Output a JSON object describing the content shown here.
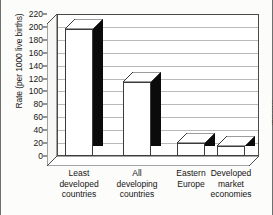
{
  "chart_data": {
    "type": "bar",
    "title": "",
    "subtitle": "",
    "xlabel": "",
    "ylabel": "Rate (per 1000 live births)",
    "ylim": [
      0,
      220
    ],
    "ytick_step": 20,
    "yticks": [
      0,
      20,
      40,
      60,
      80,
      100,
      120,
      140,
      160,
      180,
      200,
      220
    ],
    "grid": true,
    "legend": "none",
    "style": "3d-bars",
    "categories": [
      "Least\ndeveloped\ncountries",
      "All\ndeveloping\ncountries",
      "Eastern\nEurope",
      "Developed\nmarket\neconomies"
    ],
    "categories_flat": [
      "Least developed countries",
      "All developing countries",
      "Eastern Europe",
      "Developed market economies"
    ],
    "values": [
      197,
      115,
      20,
      15
    ],
    "annotations": [
      "WHO 93142"
    ]
  },
  "axis": {
    "y_title": "Rate (per 1000 live births)",
    "tick_0": "0",
    "tick_20": "20",
    "tick_40": "40",
    "tick_60": "60",
    "tick_80": "80",
    "tick_100": "100",
    "tick_120": "120",
    "tick_140": "140",
    "tick_160": "160",
    "tick_180": "180",
    "tick_200": "200",
    "tick_220": "220"
  },
  "labels": {
    "cat_0": "Least\ndeveloped\ncountries",
    "cat_1": "All\ndeveloping\ncountries",
    "cat_2": "Eastern\nEurope",
    "cat_3": "Developed\nmarket\neconomies"
  },
  "credit": {
    "text": "WHO 93142"
  },
  "colors": {
    "bar_front": "#ffffff",
    "bar_side": "#0b0b0b",
    "bar_outline": "#3b3b3b",
    "background": "#fcfcfa",
    "grid": "#b9b9b9",
    "axis": "#2a2a2a",
    "text": "#141414"
  }
}
